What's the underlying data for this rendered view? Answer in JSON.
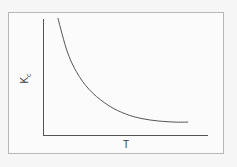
{
  "chart_data": {
    "type": "line",
    "title": "",
    "xlabel": "T",
    "ylabel": "K",
    "ylabel_subscript": "c",
    "grid": false,
    "legend": null,
    "xticks": [],
    "yticks": [],
    "series": [
      {
        "name": "Kc vs T",
        "description": "Monotonically decreasing curve, steep at low T, flattening toward an asymptote at high T",
        "x": [
          0.09,
          0.15,
          0.22,
          0.3,
          0.4,
          0.5,
          0.6,
          0.7,
          0.8,
          0.88
        ],
        "y": [
          1.0,
          0.7,
          0.5,
          0.36,
          0.25,
          0.18,
          0.14,
          0.12,
          0.11,
          0.11
        ]
      }
    ],
    "xlim": [
      0,
      1
    ],
    "ylim": [
      0,
      1
    ],
    "colors": {
      "axis": "#555555",
      "curve": "#555555",
      "frame": "#b8b8b8"
    }
  },
  "labels": {
    "x": "T",
    "y_main": "K",
    "y_sub": "c"
  }
}
